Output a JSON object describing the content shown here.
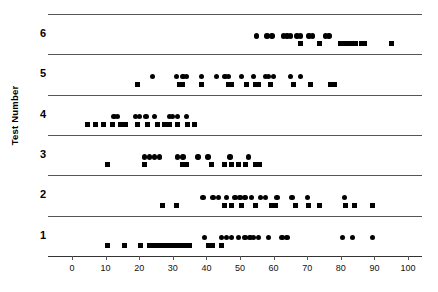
{
  "chart_data": {
    "type": "scatter",
    "title": "",
    "xlabel": "",
    "ylabel": "Test Number",
    "xlim": [
      0,
      105
    ],
    "xticks": [
      0,
      10,
      20,
      30,
      40,
      50,
      60,
      70,
      80,
      90,
      100
    ],
    "xticklabels": [
      "0",
      "10",
      "20",
      "30",
      "40",
      "50",
      "60",
      "70",
      "80",
      "90",
      "100"
    ],
    "yticklabels": [
      "1",
      "2",
      "3",
      "4",
      "5",
      "6"
    ],
    "grid": false,
    "legend": null,
    "marker_color": "#000000",
    "marker_shapes": [
      "square",
      "circle",
      "triangle"
    ],
    "rows": [
      {
        "label": "6",
        "series": [
          {
            "shape": "circle",
            "values": [
              55,
              58,
              59.5,
              63,
              64,
              65,
              67,
              68,
              70.5,
              71.5,
              75.5,
              76.5
            ]
          },
          {
            "shape": "triangle",
            "values": [
              62,
              64.5,
              65.5,
              66.5,
              68.5,
              70,
              70.8,
              71.6,
              74,
              75,
              78.5,
              79.5,
              83,
              84
            ]
          },
          {
            "shape": "square",
            "values": [
              68,
              73.5,
              80,
              81,
              82,
              83,
              84.5,
              86,
              87,
              95
            ]
          }
        ]
      },
      {
        "label": "5",
        "series": [
          {
            "shape": "circle",
            "values": [
              24,
              31,
              33,
              34,
              38.5,
              43,
              45.5,
              46.5,
              50.5,
              54,
              57.5,
              58.5,
              60,
              65,
              68
            ]
          },
          {
            "shape": "triangle",
            "values": [
              30,
              31,
              34,
              38.5,
              42,
              44.5,
              46,
              47.5,
              49,
              57.5,
              58.8,
              60,
              68.5
            ]
          },
          {
            "shape": "square",
            "values": [
              19.5,
              32,
              33,
              38.5,
              46.5,
              47.5,
              52,
              54.5,
              55.5,
              59,
              66,
              71,
              77,
              78
            ]
          }
        ]
      },
      {
        "label": "4",
        "series": [
          {
            "shape": "circle",
            "values": [
              12.5,
              13.5,
              19,
              20,
              22,
              24.5,
              29,
              30,
              31.5,
              34
            ]
          },
          {
            "shape": "triangle",
            "values": [
              28.5,
              29.5,
              30.5,
              31.5,
              32.5,
              33.5,
              34.5,
              35.5
            ]
          },
          {
            "shape": "square",
            "values": [
              4.5,
              7,
              9.5,
              12,
              14.5,
              16,
              19.5,
              22.5,
              25.5,
              27.5,
              29,
              31.5,
              34.5,
              36.5
            ]
          }
        ]
      },
      {
        "label": "3",
        "series": [
          {
            "shape": "circle",
            "values": [
              21.5,
              23,
              24.5,
              26,
              31.5,
              33,
              37.5,
              40.5,
              47,
              52.5
            ]
          },
          {
            "shape": "triangle",
            "values": [
              44.5,
              45.7,
              47.5,
              48.8,
              50,
              51.2,
              55,
              56.3,
              58.5,
              59.7,
              61,
              62.2,
              68.5,
              73.5
            ]
          },
          {
            "shape": "square",
            "values": [
              10.5,
              21.5,
              33,
              34,
              41.5,
              45.5,
              47.5,
              49.5,
              51.5,
              54.5,
              55.8
            ]
          }
        ]
      },
      {
        "label": "2",
        "series": [
          {
            "shape": "circle",
            "values": [
              39,
              42,
              43.5,
              46,
              48.5,
              50,
              51.5,
              53.5,
              56,
              57.5,
              61,
              65.5,
              70,
              81
            ]
          },
          {
            "shape": "triangle",
            "values": [
              21,
              38.5,
              42.5,
              48.5,
              49.5,
              50.5,
              51.5,
              55,
              58,
              61.5,
              69,
              70.5
            ]
          },
          {
            "shape": "square",
            "values": [
              27,
              31,
              45.5,
              47.5,
              50.5,
              54.5,
              59.5,
              60.5,
              66.5,
              70.5,
              73.5,
              81.5,
              84,
              89.5
            ]
          }
        ]
      },
      {
        "label": "1",
        "series": [
          {
            "shape": "circle",
            "values": [
              39.5,
              44.5,
              46,
              47.5,
              49.5,
              51.5,
              53,
              54,
              55.5,
              58.5,
              62.5,
              64,
              80.5,
              83.5,
              89.5
            ]
          },
          {
            "shape": "triangle",
            "values": [
              44,
              47.5,
              48.8,
              50,
              53,
              54.2,
              62.5,
              63.8,
              65.5,
              69.5,
              70.8,
              74,
              77.5
            ]
          },
          {
            "shape": "square",
            "values": [
              10.5,
              15.5,
              20.5,
              23,
              24.5,
              26,
              27.5,
              29,
              30.5,
              32,
              33.5,
              35,
              40.5,
              41.8,
              44.5
            ]
          }
        ]
      }
    ]
  }
}
